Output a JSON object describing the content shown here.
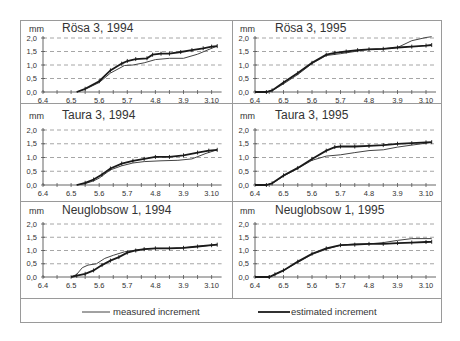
{
  "figure": {
    "unit_label": "mm",
    "legend": {
      "measured_label": "measured increment",
      "estimated_label": "estimated increment"
    }
  },
  "chart_data": [
    {
      "type": "line",
      "title": "Rösa 3, 1994",
      "ylabel": "mm",
      "xlabel": "",
      "ylim": [
        0,
        2.0
      ],
      "yticks": [
        "0,0",
        "0,5",
        "1,0",
        "1,5",
        "2,0"
      ],
      "xticks": [
        "6.4",
        "6.5",
        "5.6",
        "5.7",
        "4.8",
        "3.9",
        "3.10"
      ],
      "grid": true,
      "series": [
        {
          "name": "measured increment",
          "x": [
            1.2,
            1.5,
            2.0,
            2.4,
            2.9,
            3.2,
            3.6,
            4.0,
            4.5,
            5.0,
            5.5,
            6.0,
            6.2
          ],
          "y": [
            0.0,
            0.1,
            0.35,
            0.7,
            0.98,
            1.0,
            1.08,
            1.2,
            1.25,
            1.25,
            1.4,
            1.62,
            1.7
          ]
        },
        {
          "name": "estimated increment",
          "x": [
            1.2,
            1.5,
            2.0,
            2.4,
            2.8,
            3.0,
            3.3,
            3.7,
            3.9,
            4.2,
            4.5,
            4.9,
            5.3,
            5.7,
            6.0,
            6.2
          ],
          "y": [
            0.0,
            0.12,
            0.4,
            0.8,
            1.05,
            1.15,
            1.22,
            1.25,
            1.38,
            1.42,
            1.42,
            1.48,
            1.55,
            1.62,
            1.68,
            1.7
          ]
        }
      ]
    },
    {
      "type": "line",
      "title": "Rösa 3, 1995",
      "ylabel": "mm",
      "xlabel": "",
      "ylim": [
        0,
        2.0
      ],
      "yticks": [
        "0,0",
        "0,5",
        "1,0",
        "1,5",
        "2,0"
      ],
      "xticks": [
        "6.4",
        "6.5",
        "5.6",
        "5.7",
        "4.8",
        "3.9",
        "3.10"
      ],
      "grid": true,
      "series": [
        {
          "name": "measured increment",
          "x": [
            0.0,
            0.4,
            0.6,
            1.0,
            1.5,
            2.0,
            2.5,
            3.0,
            3.5,
            4.0,
            4.5,
            5.0,
            5.5,
            6.0,
            6.2
          ],
          "y": [
            0.0,
            0.0,
            0.05,
            0.3,
            0.65,
            1.05,
            1.35,
            1.42,
            1.5,
            1.58,
            1.6,
            1.65,
            1.9,
            2.02,
            2.05
          ]
        },
        {
          "name": "estimated increment",
          "x": [
            0.0,
            0.4,
            0.6,
            1.0,
            1.5,
            2.0,
            2.5,
            2.8,
            3.2,
            3.6,
            4.0,
            4.5,
            5.0,
            5.5,
            6.0,
            6.2
          ],
          "y": [
            0.0,
            0.0,
            0.06,
            0.35,
            0.7,
            1.08,
            1.38,
            1.45,
            1.5,
            1.55,
            1.58,
            1.6,
            1.65,
            1.68,
            1.72,
            1.74
          ]
        }
      ]
    },
    {
      "type": "line",
      "title": "Taura 3, 1994",
      "ylabel": "mm",
      "xlabel": "",
      "ylim": [
        0,
        2.0
      ],
      "yticks": [
        "0,0",
        "0,5",
        "1,0",
        "1,5",
        "2,0"
      ],
      "xticks": [
        "6.4",
        "6.5",
        "5.6",
        "5.7",
        "4.8",
        "3.9",
        "3.10"
      ],
      "grid": true,
      "series": [
        {
          "name": "measured increment",
          "x": [
            1.2,
            1.5,
            1.8,
            2.0,
            2.4,
            2.8,
            3.2,
            3.6,
            4.2,
            4.8,
            5.3,
            5.8,
            6.2
          ],
          "y": [
            0.0,
            0.05,
            0.15,
            0.25,
            0.55,
            0.7,
            0.8,
            0.85,
            0.88,
            0.9,
            0.95,
            1.15,
            1.28
          ]
        },
        {
          "name": "estimated increment",
          "x": [
            1.2,
            1.5,
            1.8,
            2.1,
            2.4,
            2.8,
            3.2,
            3.6,
            4.0,
            4.5,
            5.0,
            5.5,
            5.9,
            6.2
          ],
          "y": [
            0.0,
            0.08,
            0.2,
            0.38,
            0.6,
            0.78,
            0.88,
            0.95,
            1.02,
            1.02,
            1.08,
            1.18,
            1.25,
            1.28
          ]
        }
      ]
    },
    {
      "type": "line",
      "title": "Taura 3, 1995",
      "ylabel": "mm",
      "xlabel": "",
      "ylim": [
        0,
        2.0
      ],
      "yticks": [
        "0,0",
        "0,5",
        "1,0",
        "1,5",
        "2,0"
      ],
      "xticks": [
        "6.4",
        "6.5",
        "5.6",
        "5.7",
        "4.8",
        "3.9",
        "3.10"
      ],
      "grid": true,
      "series": [
        {
          "name": "measured increment",
          "x": [
            0.0,
            0.4,
            0.6,
            1.0,
            1.5,
            2.0,
            2.5,
            3.0,
            3.5,
            4.0,
            4.5,
            5.0,
            5.5,
            6.0,
            6.2
          ],
          "y": [
            0.0,
            0.0,
            0.05,
            0.32,
            0.6,
            0.9,
            1.05,
            1.1,
            1.18,
            1.25,
            1.28,
            1.38,
            1.45,
            1.52,
            1.55
          ]
        },
        {
          "name": "estimated increment",
          "x": [
            0.0,
            0.4,
            0.6,
            1.0,
            1.5,
            2.0,
            2.5,
            2.8,
            3.0,
            3.5,
            4.0,
            4.5,
            5.0,
            5.5,
            6.0,
            6.2
          ],
          "y": [
            0.0,
            0.0,
            0.06,
            0.35,
            0.62,
            0.95,
            1.25,
            1.38,
            1.4,
            1.4,
            1.42,
            1.45,
            1.5,
            1.52,
            1.55,
            1.56
          ]
        }
      ]
    },
    {
      "type": "line",
      "title": "Neuglobsow 1, 1994",
      "ylabel": "mm",
      "xlabel": "",
      "ylim": [
        0,
        2.0
      ],
      "yticks": [
        "0,0",
        "0,5",
        "1,0",
        "1,5",
        "2,0"
      ],
      "xticks": [
        "6.4",
        "6.5",
        "5.6",
        "5.7",
        "4.8",
        "3.9",
        "3.10"
      ],
      "grid": true,
      "series": [
        {
          "name": "measured increment",
          "x": [
            1.0,
            1.2,
            1.4,
            1.6,
            1.9,
            2.2,
            2.5,
            2.9,
            3.2,
            3.6,
            4.0,
            4.5,
            5.0,
            5.5,
            6.0,
            6.2
          ],
          "y": [
            0.0,
            0.1,
            0.35,
            0.45,
            0.5,
            0.7,
            0.82,
            0.95,
            1.0,
            1.05,
            1.08,
            1.08,
            1.1,
            1.15,
            1.2,
            1.22
          ]
        },
        {
          "name": "estimated increment",
          "x": [
            1.0,
            1.2,
            1.5,
            1.8,
            2.1,
            2.4,
            2.7,
            3.0,
            3.3,
            3.6,
            4.0,
            4.5,
            5.0,
            5.5,
            6.0,
            6.2
          ],
          "y": [
            0.0,
            0.05,
            0.12,
            0.25,
            0.45,
            0.62,
            0.75,
            0.92,
            1.0,
            1.05,
            1.08,
            1.08,
            1.1,
            1.15,
            1.2,
            1.22
          ]
        }
      ]
    },
    {
      "type": "line",
      "title": "Neuglobsow 1, 1995",
      "ylabel": "mm",
      "xlabel": "",
      "ylim": [
        0,
        2.0
      ],
      "yticks": [
        "0,0",
        "0,5",
        "1,0",
        "1,5",
        "2,0"
      ],
      "xticks": [
        "6.4",
        "6.5",
        "5.6",
        "5.7",
        "4.8",
        "3.9",
        "3.10"
      ],
      "grid": true,
      "series": [
        {
          "name": "measured increment",
          "x": [
            0.0,
            0.5,
            0.7,
            1.0,
            1.5,
            2.0,
            2.5,
            3.0,
            3.5,
            4.0,
            4.5,
            5.0,
            5.5,
            6.0,
            6.2
          ],
          "y": [
            0.0,
            0.0,
            0.1,
            0.25,
            0.55,
            0.85,
            1.05,
            1.2,
            1.25,
            1.25,
            1.3,
            1.38,
            1.45,
            1.45,
            1.45
          ]
        },
        {
          "name": "estimated increment",
          "x": [
            0.0,
            0.5,
            0.7,
            1.0,
            1.5,
            2.0,
            2.5,
            3.0,
            3.5,
            4.0,
            4.5,
            5.0,
            5.5,
            6.0,
            6.2
          ],
          "y": [
            0.0,
            0.0,
            0.1,
            0.25,
            0.58,
            0.88,
            1.08,
            1.2,
            1.22,
            1.25,
            1.25,
            1.28,
            1.3,
            1.32,
            1.33
          ]
        }
      ]
    }
  ]
}
